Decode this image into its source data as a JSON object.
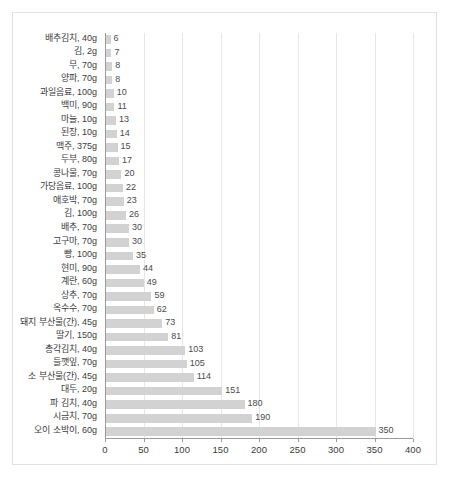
{
  "chart_data": {
    "type": "bar",
    "orientation": "horizontal",
    "title": "",
    "subtitle": "",
    "xlabel": "",
    "ylabel": "",
    "xlim": [
      0,
      400
    ],
    "xticks": [
      0,
      50,
      100,
      150,
      200,
      250,
      300,
      350,
      400
    ],
    "grid": true,
    "legend": null,
    "bar_color": "#d2d2d2",
    "axis_color": "#9a9a9a",
    "gridline_color": "#e6e6e6",
    "label_color": "#3c3c3c",
    "value_label_color": "#4b4b4b",
    "frame_border_color": "#e2e2e2",
    "background": "#ffffff",
    "categories": [
      "배추김치, 40g",
      "김, 2g",
      "무, 70g",
      "양파, 70g",
      "과일음료, 100g",
      "백미, 90g",
      "마늘, 10g",
      "된장, 10g",
      "맥주, 375g",
      "두부, 80g",
      "콩나물, 70g",
      "가당음료, 100g",
      "애호박, 70g",
      "김, 100g",
      "배추, 70g",
      "고구마, 70g",
      "빵, 100g",
      "현미, 90g",
      "계란, 60g",
      "상추, 70g",
      "옥수수, 70g",
      "돼지 부산물(간), 45g",
      "딸기, 150g",
      "총각김치, 40g",
      "들깻잎, 70g",
      "소 부산물(간), 45g",
      "대두, 20g",
      "파 김치, 40g",
      "시금치, 70g",
      "오이 소박이, 60g"
    ],
    "values": [
      6,
      7,
      8,
      8,
      10,
      11,
      13,
      14,
      15,
      17,
      20,
      22,
      23,
      26,
      30,
      30,
      35,
      44,
      49,
      59,
      62,
      73,
      81,
      103,
      105,
      114,
      151,
      180,
      190,
      350
    ],
    "value_labels": [
      "6",
      "7",
      "8",
      "8",
      "10",
      "11",
      "13",
      "14",
      "15",
      "17",
      "20",
      "22",
      "23",
      "26",
      "30",
      "30",
      "35",
      "44",
      "49",
      "59",
      "62",
      "73",
      "81",
      "103",
      "105",
      "114",
      "151",
      "180",
      "190",
      "350"
    ]
  }
}
